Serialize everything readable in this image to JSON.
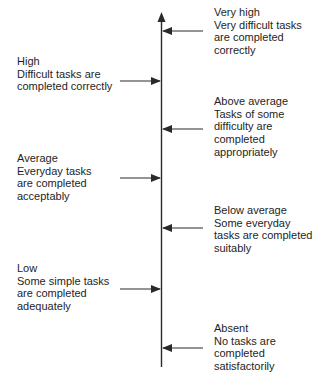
{
  "diagram": {
    "type": "vertical-scale",
    "axis_direction": "up",
    "colors": {
      "line": "#2a2a2a",
      "text": "#1e1e1e",
      "background": "#ffffff"
    },
    "levels": [
      {
        "id": "very-high",
        "side": "right",
        "title": "Very high",
        "lines": [
          "Very difficult tasks",
          "are completed",
          "correctly"
        ]
      },
      {
        "id": "high",
        "side": "left",
        "title": "High",
        "lines": [
          "Difficult tasks are",
          "completed correctly"
        ]
      },
      {
        "id": "above-average",
        "side": "right",
        "title": "Above average",
        "lines": [
          "Tasks of some",
          "difficulty are",
          "completed",
          "appropriately"
        ]
      },
      {
        "id": "average",
        "side": "left",
        "title": "Average",
        "lines": [
          "Everyday tasks",
          "are completed",
          "acceptably"
        ]
      },
      {
        "id": "below-average",
        "side": "right",
        "title": "Below average",
        "lines": [
          "Some everyday",
          "tasks are completed",
          "suitably"
        ]
      },
      {
        "id": "low",
        "side": "left",
        "title": "Low",
        "lines": [
          "Some simple tasks",
          "are completed",
          "adequately"
        ]
      },
      {
        "id": "absent",
        "side": "right",
        "title": "Absent",
        "lines": [
          "No tasks are",
          "completed",
          "satisfactorily"
        ]
      }
    ]
  }
}
